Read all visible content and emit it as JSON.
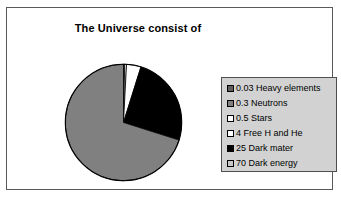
{
  "chart_data": {
    "type": "pie",
    "title": "The Universe consist of",
    "categories": [
      "Heavy elements",
      "Neutrons",
      "Stars",
      "Free H and He",
      "Dark mater",
      "Dark energy"
    ],
    "values": [
      0.03,
      0.3,
      0.5,
      4,
      25,
      70
    ],
    "unit": "percent",
    "start_angle_deg": 0,
    "direction": "clockwise",
    "legend_position": "right",
    "grid": false,
    "xlabel": "",
    "ylabel": "",
    "slices": [
      {
        "label": "0.03 Heavy elements",
        "name": "Heavy elements",
        "value": 0.03,
        "color": "#3c3c3c",
        "swatch": "#5e5e5e"
      },
      {
        "label": "0.3 Neutrons",
        "name": "Neutrons",
        "value": 0.3,
        "color": "#6e6e6e",
        "swatch": "#808080"
      },
      {
        "label": "0.5 Stars",
        "name": "Stars",
        "value": 0.5,
        "color": "#ffffff",
        "swatch": "#ffffff"
      },
      {
        "label": "4 Free H and He",
        "name": "Free H and He",
        "value": 4,
        "color": "#ffffff",
        "swatch": "#ffffff"
      },
      {
        "label": "25 Dark mater",
        "name": "Dark mater",
        "value": 25,
        "color": "#000000",
        "swatch": "#000000"
      },
      {
        "label": "70 Dark energy",
        "name": "Dark energy",
        "value": 70,
        "color": "#808080",
        "swatch": "#c8c8c8"
      }
    ]
  },
  "chart": {
    "title": "The Universe consist of",
    "frame_border_color": "#5a5a5a",
    "plot_background": "#ffffff",
    "slice_outline_color": "#000000"
  },
  "legend": {
    "background_color": "#d2d2d2",
    "border_color": "#4f4f4f",
    "items": [
      {
        "label": "0.03 Heavy elements"
      },
      {
        "label": "0.3 Neutrons"
      },
      {
        "label": "0.5 Stars"
      },
      {
        "label": "4 Free H and He"
      },
      {
        "label": "25 Dark mater"
      },
      {
        "label": "70 Dark energy"
      }
    ]
  }
}
